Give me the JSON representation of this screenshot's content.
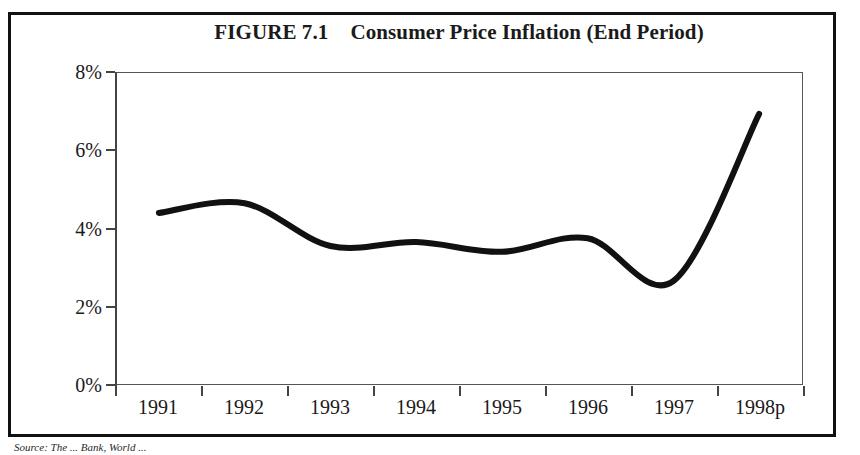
{
  "figure": {
    "number_label": "FIGURE 7.1",
    "title": "Consumer Price Inflation (End Period)",
    "source_note": "Source: The ... Bank, World ..."
  },
  "chart_data": {
    "type": "line",
    "xlabel": "",
    "ylabel": "",
    "categories": [
      "1991",
      "1992",
      "1993",
      "1994",
      "1995",
      "1996",
      "1997",
      "1998p"
    ],
    "values": [
      4.4,
      4.65,
      3.55,
      3.65,
      3.4,
      3.75,
      2.65,
      6.95
    ],
    "series": [
      {
        "name": "Consumer Price Inflation (End Period)",
        "values": [
          4.4,
          4.65,
          3.55,
          3.65,
          3.4,
          3.75,
          2.65,
          6.95
        ],
        "color": "#111111"
      }
    ],
    "ylim": [
      0,
      8
    ],
    "ytick_values": [
      8,
      6,
      4,
      2,
      0
    ],
    "ytick_labels": [
      "8%",
      "6%",
      "4%",
      "2%",
      "0%"
    ],
    "xtick_labels": [
      "1991",
      "1992",
      "1993",
      "1994",
      "1995",
      "1996",
      "1997",
      "1998p"
    ],
    "grid": false,
    "legend": false,
    "line_style": "smooth-spline",
    "line_width_px": 6
  }
}
